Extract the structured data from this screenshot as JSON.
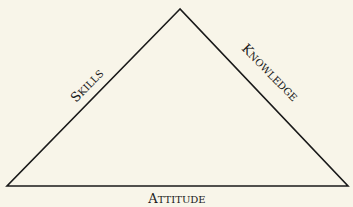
{
  "diagram": {
    "type": "triangle",
    "background": "#f8f5e9",
    "stroke_color": "#1a1a1a",
    "sides": {
      "left": {
        "label": "Skills",
        "first": "S",
        "rest": "KILLS"
      },
      "right": {
        "label": "Knowledge",
        "first": "K",
        "rest": "NOWLEDGE"
      },
      "bottom": {
        "label": "Attitude",
        "first": "A",
        "rest": "TTITUDE"
      }
    }
  }
}
